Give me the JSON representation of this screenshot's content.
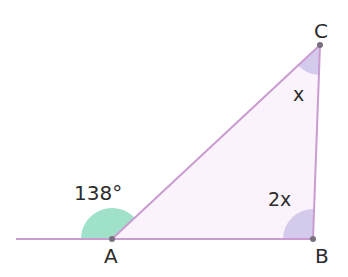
{
  "diagram": {
    "type": "geometry-triangle",
    "vertices": {
      "A": {
        "label": "A",
        "x": 112,
        "y": 239
      },
      "B": {
        "label": "B",
        "x": 313,
        "y": 239
      },
      "C": {
        "label": "C",
        "x": 320,
        "y": 45
      }
    },
    "baseline": {
      "x1": 16,
      "x2": 313,
      "y": 239
    },
    "angles": {
      "exterior_A": {
        "label": "138°",
        "color": "#8fdcc0"
      },
      "angle_C": {
        "label": "x",
        "color": "#cfc6ea"
      },
      "angle_B": {
        "label": "2x",
        "color": "#cfc6ea"
      }
    },
    "colors": {
      "stroke": "#c99bd0",
      "fill": "#fbf3fb",
      "point": "#7a6f80",
      "text": "#2b2b2b"
    }
  }
}
